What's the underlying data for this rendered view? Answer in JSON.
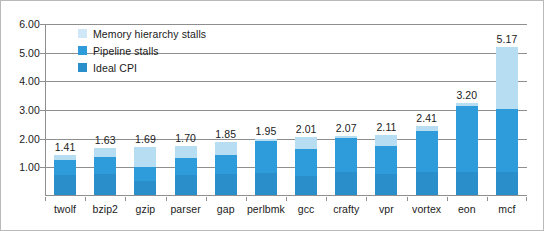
{
  "chart_data": {
    "type": "bar",
    "subtype": "stacked-bar",
    "title": "",
    "xlabel": "",
    "ylabel": "",
    "ylim": [
      0,
      6
    ],
    "ytick_step": 1,
    "ytick_labels": [
      "1.00",
      "2.00",
      "3.00",
      "4.00",
      "5.00",
      "6.00"
    ],
    "ytick_values": [
      1,
      2,
      3,
      4,
      5,
      6
    ],
    "grid": true,
    "legend_position": "upper-left-inside",
    "categories": [
      "twolf",
      "bzip2",
      "gzip",
      "parser",
      "gap",
      "perlbmk",
      "gcc",
      "crafty",
      "vpr",
      "vortex",
      "eon",
      "mcf"
    ],
    "series": [
      {
        "name": "Ideal CPI",
        "color": "#2a8ecb",
        "values": [
          0.7,
          0.72,
          0.5,
          0.7,
          0.72,
          0.78,
          0.68,
          0.8,
          0.72,
          0.8,
          0.82,
          0.8
        ]
      },
      {
        "name": "Pipeline stalls",
        "color": "#2e9bda",
        "values": [
          0.51,
          0.61,
          0.47,
          0.6,
          0.68,
          1.09,
          0.94,
          1.2,
          0.98,
          1.45,
          2.3,
          2.2
        ]
      },
      {
        "name": "Memory hierarchy stalls",
        "color": "#b7ddf2",
        "values": [
          0.2,
          0.3,
          0.72,
          0.4,
          0.45,
          0.08,
          0.39,
          0.07,
          0.41,
          0.16,
          0.08,
          2.17
        ]
      }
    ],
    "totals": [
      1.41,
      1.63,
      1.69,
      1.7,
      1.85,
      1.95,
      2.01,
      2.07,
      2.11,
      2.41,
      3.2,
      5.17
    ],
    "total_labels": [
      "1.41",
      "1.63",
      "1.69",
      "1.70",
      "1.85",
      "1.95",
      "2.01",
      "2.07",
      "2.11",
      "2.41",
      "3.20",
      "5.17"
    ],
    "legend": [
      {
        "label": "Memory hierarchy stalls",
        "color": "#cfe7f7"
      },
      {
        "label": "Pipeline stalls",
        "color": "#2e9bda"
      },
      {
        "label": "Ideal CPI",
        "color": "#2a8ecb"
      }
    ]
  }
}
